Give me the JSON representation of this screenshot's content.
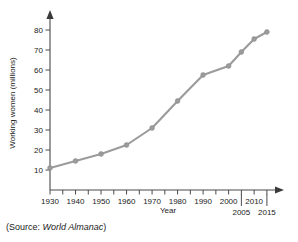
{
  "source_note": {
    "prefix": "(Source: ",
    "publication": "World Almanac",
    "suffix": ")",
    "full": "(Source: World Almanac)"
  },
  "style": {
    "line_color": "#9b9b9b",
    "marker_color": "#9b9b9b",
    "axis_color": "#4a4a4a",
    "text_color": "#1a1a1a",
    "background": "#ffffff"
  },
  "chart_data": {
    "type": "line",
    "title": "",
    "xlabel": "Year",
    "ylabel": "Working women (millions)",
    "x": [
      1930,
      1940,
      1950,
      1960,
      1970,
      1980,
      1990,
      2000,
      2005,
      2010,
      2015
    ],
    "values": [
      11,
      14.5,
      18,
      22.5,
      31,
      44.5,
      57.5,
      62,
      69,
      75.5,
      79
    ],
    "series": [
      {
        "name": "Working women",
        "values": [
          11,
          14.5,
          18,
          22.5,
          31,
          44.5,
          57.5,
          62,
          69,
          75.5,
          79
        ]
      }
    ],
    "xlim": [
      1930,
      2017
    ],
    "ylim": [
      0,
      85
    ],
    "x_tick_labels_primary": [
      "1930",
      "1940",
      "1950",
      "1960",
      "1970",
      "1980",
      "1990",
      "2000",
      "2010"
    ],
    "x_tick_values_primary": [
      1930,
      1940,
      1950,
      1960,
      1970,
      1980,
      1990,
      2000,
      2010
    ],
    "x_tick_labels_secondary": [
      "2005",
      "2015"
    ],
    "x_tick_values_secondary": [
      2005,
      2015
    ],
    "x_minor_tick_values": [
      1935,
      1945,
      1955,
      1965,
      1975,
      1985,
      1995,
      2005,
      2015
    ],
    "y_tick_labels": [
      "10",
      "20",
      "30",
      "40",
      "50",
      "60",
      "70",
      "80"
    ],
    "y_tick_values": [
      10,
      20,
      30,
      40,
      50,
      60,
      70,
      80
    ],
    "grid": false,
    "legend": false,
    "markers": true,
    "axis_arrows": true
  }
}
